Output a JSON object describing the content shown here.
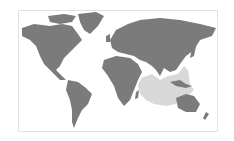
{
  "map": {
    "type": "world-map",
    "projection": "equirectangular-like",
    "land_color": "#7b7b7b",
    "highlight_color": "#d9d9d9",
    "frame_color": "#e2e2e2",
    "background": "#ffffff",
    "highlighted_region": "Indian Ocean"
  }
}
